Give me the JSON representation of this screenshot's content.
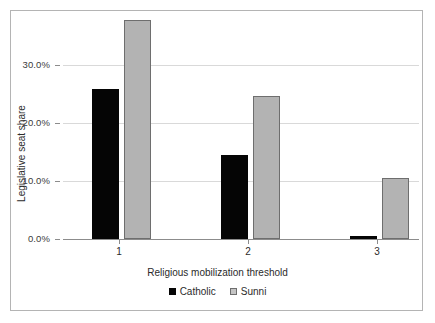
{
  "chart_data": {
    "type": "bar",
    "title": "",
    "xlabel": "Religious mobilization threshold",
    "ylabel": "Legislative seat share",
    "categories": [
      "1",
      "2",
      "3"
    ],
    "series": [
      {
        "name": "Catholic",
        "color": "#050505",
        "values": [
          25.9,
          14.5,
          0.5
        ]
      },
      {
        "name": "Sunni",
        "color": "#b3b3b3",
        "values": [
          37.8,
          24.7,
          10.5
        ]
      }
    ],
    "ylim": [
      0,
      38.8
    ],
    "y_ticks": [
      0,
      10,
      20,
      30
    ],
    "y_tick_labels": [
      "0.0%",
      "10.0%",
      "20.0%",
      "30.0%"
    ],
    "x_tick_labels": [
      "1",
      "2",
      "3"
    ],
    "grid": "horizontal",
    "legend_position": "bottom-center",
    "frame": true
  },
  "axes": {
    "y_title": "Legislative seat share",
    "x_title": "Religious mobilization threshold"
  },
  "legend": {
    "items": [
      {
        "label": "Catholic"
      },
      {
        "label": "Sunni"
      }
    ]
  },
  "colors": {
    "catholic": "#050505",
    "sunni": "#b3b3b3",
    "sunni_edge": "#6e6e6e",
    "grid": "#d9d9d9",
    "axis": "#8c8c8c",
    "frame": "#b4b4b4",
    "text": "#2b2b2b",
    "background": "#ffffff"
  }
}
